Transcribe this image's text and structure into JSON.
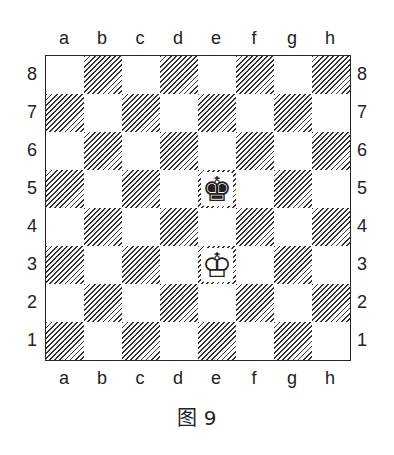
{
  "files": [
    "a",
    "b",
    "c",
    "d",
    "e",
    "f",
    "g",
    "h"
  ],
  "ranks": [
    "8",
    "7",
    "6",
    "5",
    "4",
    "3",
    "2",
    "1"
  ],
  "pieces": [
    {
      "square": "e5",
      "glyph": "♚",
      "name": "black-king"
    },
    {
      "square": "e3",
      "glyph": "♔",
      "name": "white-king"
    }
  ],
  "caption": "图 9"
}
